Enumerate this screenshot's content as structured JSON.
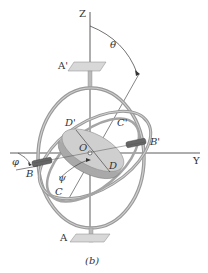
{
  "figure": {
    "caption": "(b)",
    "labels": {
      "z_axis": "Z",
      "y_axis": "Y",
      "theta": "θ",
      "a_prime": "A'",
      "a": "A",
      "d_prime": "D'",
      "c_prime": "C'",
      "origin": "O",
      "d": "D",
      "b_prime": "B'",
      "b": "B",
      "phi": "φ",
      "psi": "ψ",
      "c": "C"
    },
    "colors": {
      "line": "#333333",
      "ring": "#9a9a9a",
      "ring_highlight": "#d0d0d0",
      "disk_top": "#cfcfcf",
      "disk_side": "#b0b0b0",
      "plate": "#d8d8d8",
      "shaft_dark": "#555555"
    }
  }
}
